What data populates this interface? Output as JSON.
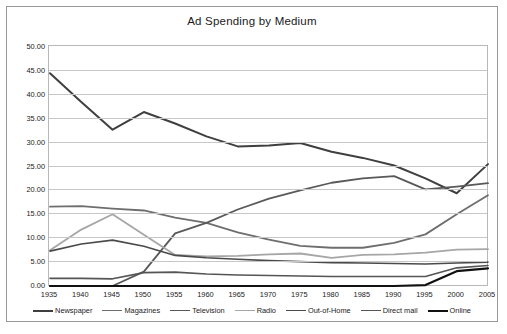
{
  "chart": {
    "title": "Ad Spending by Medium"
  },
  "chart_data": {
    "type": "line",
    "title": "Ad Spending by Medium",
    "xlabel": "",
    "ylabel": "",
    "x": [
      1935,
      1940,
      1945,
      1950,
      1955,
      1960,
      1965,
      1970,
      1975,
      1980,
      1985,
      1990,
      1995,
      2000,
      2005
    ],
    "xtick_labels": [
      "1935",
      "1940",
      "1945",
      "1950",
      "1955",
      "1960",
      "1965",
      "1970",
      "1975",
      "1980",
      "1985",
      "1990",
      "1995",
      "2000",
      "2005"
    ],
    "ytick_labels": [
      "0.00",
      "5.00",
      "10.00",
      "15.00",
      "20.00",
      "25.00",
      "30.00",
      "35.00",
      "40.00",
      "45.00",
      "50.00"
    ],
    "ylim": [
      0,
      50
    ],
    "ytick_step": 5,
    "xlim": [
      1935,
      2005
    ],
    "grid": true,
    "legend_position": "bottom",
    "series": [
      {
        "name": "Newspaper",
        "color": "#3f3f3f",
        "width": 2.0,
        "values": [
          44.5,
          38.5,
          32.7,
          36.4,
          34.0,
          31.3,
          29.2,
          29.4,
          29.9,
          28.1,
          26.8,
          25.2,
          22.5,
          19.4,
          25.5
        ]
      },
      {
        "name": "Magazines",
        "color": "#6e6e6e",
        "width": 1.8,
        "values": [
          16.6,
          16.7,
          16.2,
          15.8,
          14.3,
          13.2,
          11.2,
          9.7,
          8.4,
          8.0,
          8.0,
          9.0,
          10.8,
          15.0,
          19.0
        ]
      },
      {
        "name": "Television",
        "color": "#595959",
        "width": 1.8,
        "values": [
          0.0,
          0.0,
          0.0,
          3.0,
          11.0,
          13.2,
          16.0,
          18.3,
          20.0,
          21.6,
          22.5,
          23.0,
          20.2,
          20.8,
          21.5
        ]
      },
      {
        "name": "Radio",
        "color": "#a6a6a6",
        "width": 1.8,
        "values": [
          7.5,
          11.8,
          15.0,
          10.7,
          6.5,
          6.2,
          6.3,
          6.6,
          6.8,
          5.9,
          6.5,
          6.6,
          7.0,
          7.6,
          7.7
        ]
      },
      {
        "name": "Out-of-Home",
        "color": "#4a4a4a",
        "width": 1.6,
        "values": [
          7.3,
          8.8,
          9.6,
          8.3,
          6.4,
          5.9,
          5.6,
          5.3,
          5.1,
          4.9,
          4.8,
          4.7,
          4.6,
          4.8,
          5.0
        ]
      },
      {
        "name": "Direct mail",
        "color": "#555555",
        "width": 1.6,
        "values": [
          1.6,
          1.6,
          1.5,
          2.8,
          2.9,
          2.5,
          2.3,
          2.2,
          2.1,
          2.0,
          2.0,
          2.0,
          2.0,
          3.8,
          4.3
        ]
      },
      {
        "name": "Online",
        "color": "#111111",
        "width": 2.2,
        "values": [
          0.0,
          0.0,
          0.0,
          0.0,
          0.0,
          0.0,
          0.0,
          0.0,
          0.0,
          0.0,
          0.0,
          0.0,
          0.2,
          3.1,
          3.7
        ]
      }
    ]
  }
}
